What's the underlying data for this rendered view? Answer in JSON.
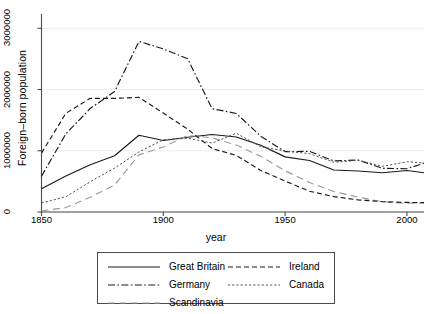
{
  "chart_data": {
    "type": "line",
    "title": "",
    "xlabel": "year",
    "ylabel": "Foreign–born population",
    "xlim": [
      1850,
      2007
    ],
    "ylim": [
      0,
      3200000
    ],
    "xticks": [
      1850,
      1900,
      1950,
      2000
    ],
    "yticks": [
      0,
      1000000,
      2000000,
      3000000
    ],
    "ytick_labels": [
      "0",
      "1000000",
      "2000000",
      "3000000"
    ],
    "grid": "horizontal",
    "legend_position": "below-center",
    "series": [
      {
        "name": "Great Britain",
        "style": "solid",
        "color": "#1a1a1a",
        "x": [
          1850,
          1860,
          1870,
          1880,
          1890,
          1900,
          1910,
          1920,
          1930,
          1940,
          1950,
          1960,
          1970,
          1980,
          1990,
          2000,
          2007
        ],
        "values": [
          379000,
          588000,
          771000,
          918000,
          1252000,
          1168000,
          1221000,
          1265000,
          1225000,
          1090000,
          900000,
          840000,
          686000,
          669000,
          640000,
          678000,
          640000
        ]
      },
      {
        "name": "Germany",
        "style": "dash-dot",
        "color": "#1a1a1a",
        "x": [
          1850,
          1860,
          1870,
          1880,
          1890,
          1900,
          1910,
          1920,
          1930,
          1940,
          1950,
          1960,
          1970,
          1980,
          1990,
          2000,
          2007
        ],
        "values": [
          584000,
          1276000,
          1690000,
          1967000,
          2785000,
          2663000,
          2501000,
          1686000,
          1609000,
          1237000,
          985000,
          990000,
          833000,
          849000,
          712000,
          707000,
          795000
        ]
      },
      {
        "name": "Scandinavia",
        "style": "long-dash",
        "color": "#9a9a9a",
        "x": [
          1850,
          1860,
          1870,
          1880,
          1890,
          1900,
          1910,
          1920,
          1930,
          1940,
          1950,
          1960,
          1970,
          1980,
          1990,
          2000,
          2007
        ],
        "values": [
          18000,
          72000,
          241000,
          440000,
          933000,
          1062000,
          1250000,
          1212000,
          1093000,
          908000,
          672000,
          482000,
          334000,
          243000,
          167000,
          142000,
          150000
        ]
      },
      {
        "name": "Ireland",
        "style": "dashed",
        "color": "#1a1a1a",
        "x": [
          1850,
          1860,
          1870,
          1880,
          1890,
          1900,
          1910,
          1920,
          1930,
          1940,
          1950,
          1960,
          1970,
          1980,
          1990,
          2000,
          2007
        ],
        "values": [
          961000,
          1611000,
          1856000,
          1855000,
          1872000,
          1615000,
          1352000,
          1037000,
          923000,
          678000,
          505000,
          339000,
          251000,
          198000,
          169000,
          157000,
          152000
        ]
      },
      {
        "name": "Canada",
        "style": "dotted",
        "color": "#555555",
        "x": [
          1850,
          1860,
          1870,
          1880,
          1890,
          1900,
          1910,
          1920,
          1930,
          1940,
          1950,
          1960,
          1970,
          1980,
          1990,
          2000,
          2007
        ],
        "values": [
          148000,
          249000,
          493000,
          717000,
          980000,
          1180000,
          1205000,
          1125000,
          1286000,
          1065000,
          995000,
          952000,
          812000,
          843000,
          745000,
          820000,
          800000
        ]
      }
    ]
  },
  "legend": {
    "entries": [
      {
        "label": "Great Britain",
        "key": "solid"
      },
      {
        "label": "Germany",
        "key": "dash-dot"
      },
      {
        "label": "Scandinavia",
        "key": "long-dash"
      },
      {
        "label": "Ireland",
        "key": "dashed"
      },
      {
        "label": "Canada",
        "key": "dotted"
      }
    ]
  },
  "style": {
    "axis_color": "#4a4a4a",
    "grid_color": "#ececec",
    "background": "#ffffff"
  }
}
